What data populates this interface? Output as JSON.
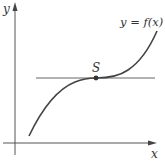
{
  "diagram": {
    "type": "function-graph",
    "axes": {
      "x_label": "x",
      "y_label": "y"
    },
    "curve": {
      "label": "y = f(x)",
      "description": "cubic-like increasing curve with an inflection point having a horizontal tangent"
    },
    "point": {
      "label": "S",
      "description": "stationary point of inflection where tangent is horizontal"
    },
    "tangent_line": {
      "description": "horizontal tangent line through S"
    },
    "colors": {
      "curve": "#444444",
      "axes": "#555555",
      "tangent": "#666666",
      "background": "#ffffff"
    }
  }
}
